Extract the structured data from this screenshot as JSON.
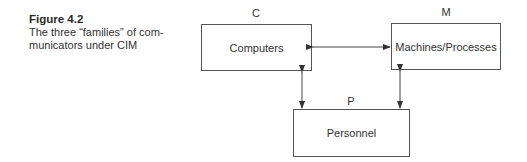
{
  "caption": {
    "figure_label": "Figure 4.2",
    "text": "The three “families” of communicators under CIM",
    "line1": "The three “families” of com-",
    "line2": "municators under CIM"
  },
  "nodes": [
    {
      "id": "C",
      "letter": "C",
      "label": "Computers"
    },
    {
      "id": "M",
      "letter": "M",
      "label": "Machines/Processes"
    },
    {
      "id": "P",
      "letter": "P",
      "label": "Personnel"
    }
  ],
  "edges": [
    {
      "from": "C",
      "to": "M",
      "direction": "bidirectional"
    },
    {
      "from": "C",
      "to": "P",
      "direction": "bidirectional"
    },
    {
      "from": "M",
      "to": "P",
      "direction": "bidirectional"
    }
  ]
}
